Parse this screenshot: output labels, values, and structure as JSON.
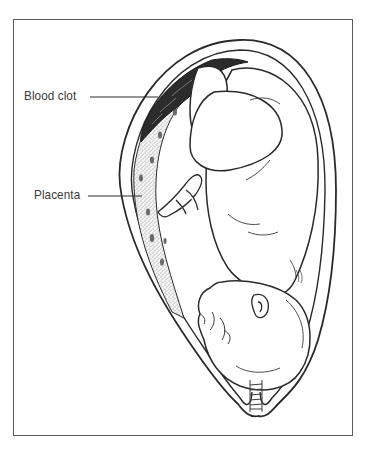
{
  "figure": {
    "labels": [
      {
        "id": "blood-clot",
        "text": "Blood clot"
      },
      {
        "id": "placenta",
        "text": "Placenta"
      }
    ],
    "colors": {
      "line": "#2a2a2a",
      "frame": "#5a5a5a",
      "clot_fill": "#2b2b2b",
      "placenta_stipple": "#9a9a9a",
      "background": "#ffffff"
    }
  }
}
